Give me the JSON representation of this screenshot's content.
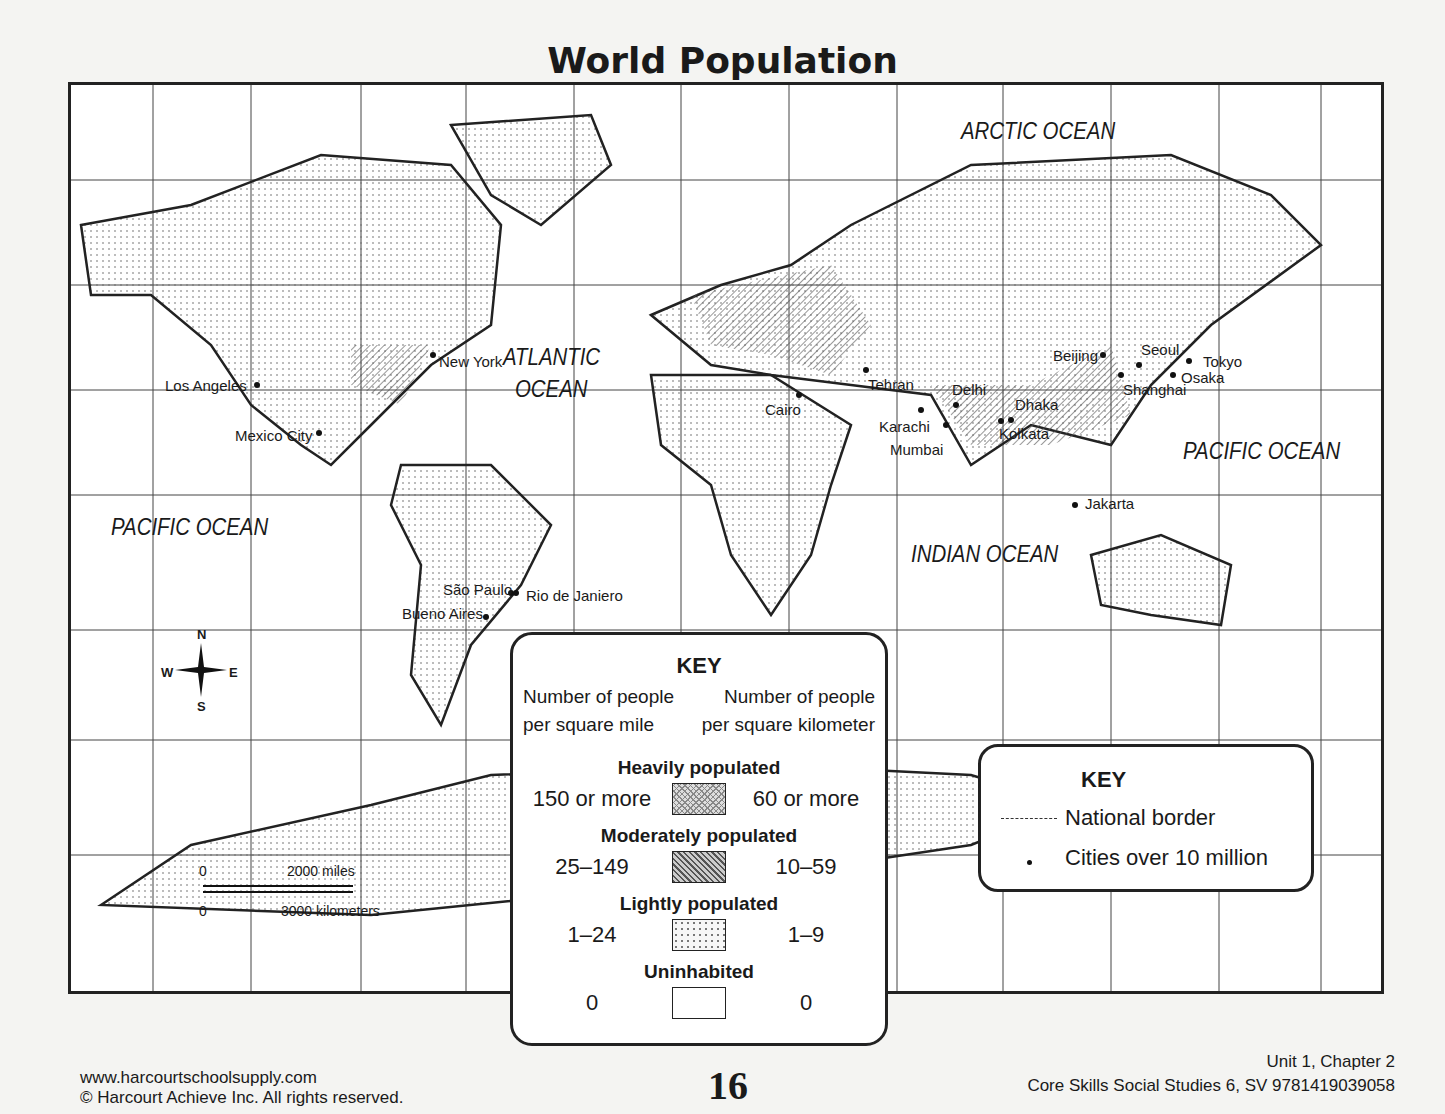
{
  "title": "World Population",
  "oceans": [
    {
      "name": "ARCTIC OCEAN",
      "x": 890,
      "y": 32
    },
    {
      "name": "ATLANTIC",
      "x": 432,
      "y": 258
    },
    {
      "name": "OCEAN",
      "x": 444,
      "y": 290
    },
    {
      "name": "PACIFIC OCEAN",
      "x": 40,
      "y": 428
    },
    {
      "name": "PACIFIC OCEAN",
      "x": 1112,
      "y": 352
    },
    {
      "name": "INDIAN OCEAN",
      "x": 840,
      "y": 455
    }
  ],
  "cities": [
    {
      "name": "New York",
      "x": 362,
      "y": 270,
      "dx": 6,
      "dy": -2
    },
    {
      "name": "Los Angeles",
      "x": 186,
      "y": 300,
      "dx": -92,
      "dy": -8
    },
    {
      "name": "Mexico City",
      "x": 248,
      "y": 348,
      "dx": -84,
      "dy": -6
    },
    {
      "name": "São Paulo",
      "x": 440,
      "y": 508,
      "dx": -68,
      "dy": -12
    },
    {
      "name": "Rio de Janiero",
      "x": 445,
      "y": 508,
      "dx": 10,
      "dy": -6
    },
    {
      "name": "Bueno Aires",
      "x": 415,
      "y": 532,
      "dx": -84,
      "dy": -12
    },
    {
      "name": "Cairo",
      "x": 728,
      "y": 310,
      "dx": -34,
      "dy": 6
    },
    {
      "name": "Tehran",
      "x": 795,
      "y": 285,
      "dx": 2,
      "dy": 6
    },
    {
      "name": "Karachi",
      "x": 850,
      "y": 325,
      "dx": -42,
      "dy": 8
    },
    {
      "name": "Mumbai",
      "x": 875,
      "y": 340,
      "dx": -56,
      "dy": 16
    },
    {
      "name": "Delhi",
      "x": 885,
      "y": 320,
      "dx": -4,
      "dy": -24
    },
    {
      "name": "Dhaka",
      "x": 940,
      "y": 335,
      "dx": 4,
      "dy": -24
    },
    {
      "name": "Kolkata",
      "x": 930,
      "y": 336,
      "dx": -2,
      "dy": 4
    },
    {
      "name": "Beijing",
      "x": 1032,
      "y": 270,
      "dx": -50,
      "dy": -8
    },
    {
      "name": "Seoul",
      "x": 1068,
      "y": 280,
      "dx": 2,
      "dy": -24
    },
    {
      "name": "Tokyo",
      "x": 1118,
      "y": 276,
      "dx": 14,
      "dy": -8
    },
    {
      "name": "Osaka",
      "x": 1102,
      "y": 290,
      "dx": 8,
      "dy": -6
    },
    {
      "name": "Shanghai",
      "x": 1050,
      "y": 290,
      "dx": 2,
      "dy": 6
    },
    {
      "name": "Jakarta",
      "x": 1004,
      "y": 420,
      "dx": 10,
      "dy": -10
    }
  ],
  "compass": {
    "n": "N",
    "s": "S",
    "e": "E",
    "w": "W"
  },
  "scale": {
    "zero": "0",
    "miles": "2000 miles",
    "km": "3000 kilometers"
  },
  "key_density": {
    "title": "KEY",
    "col_left": [
      "Number of people",
      "per square mile"
    ],
    "col_right": [
      "Number of people",
      "per square kilometer"
    ],
    "categories": [
      {
        "name": "Heavily populated",
        "sq_mile": "150 or more",
        "sq_km": "60 or more",
        "pattern": "heavy"
      },
      {
        "name": "Moderately populated",
        "sq_mile": "25–149",
        "sq_km": "10–59",
        "pattern": "mod"
      },
      {
        "name": "Lightly populated",
        "sq_mile": "1–24",
        "sq_km": "1–9",
        "pattern": "light"
      },
      {
        "name": "Uninhabited",
        "sq_mile": "0",
        "sq_km": "0",
        "pattern": "none"
      }
    ]
  },
  "key_symbols": {
    "title": "KEY",
    "border_label": "National border",
    "city_label": "Cities over 10 million"
  },
  "footer": {
    "url": "www.harcourtschoolsupply.com",
    "copyright": "© Harcourt Achieve Inc. All rights reserved.",
    "page": "16",
    "chapter": "Unit 1, Chapter 2",
    "book": "Core Skills Social Studies 6, SV 9781419039058"
  }
}
